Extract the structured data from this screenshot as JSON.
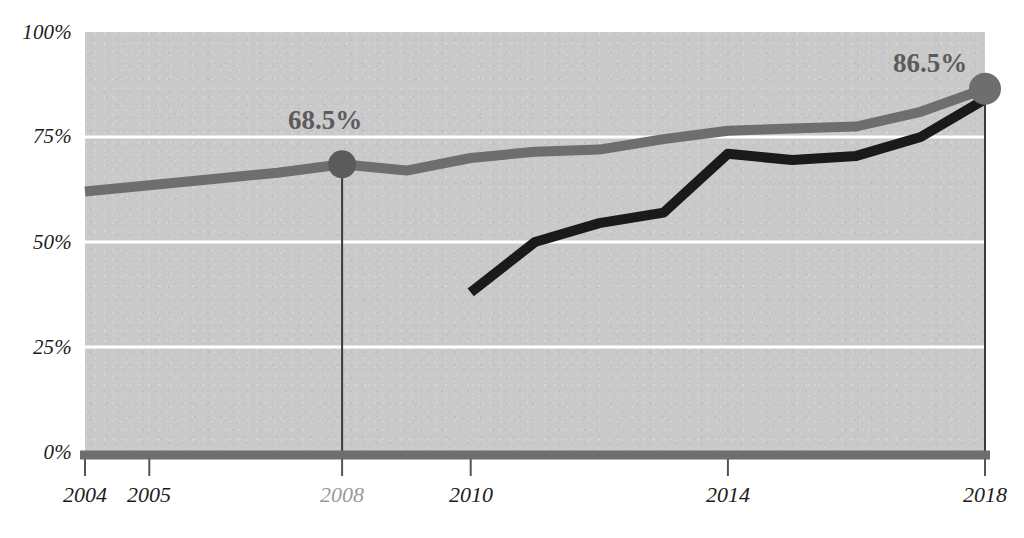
{
  "chart_data": {
    "type": "line",
    "title": "",
    "xlabel": "",
    "ylabel": "",
    "xlim": [
      2004,
      2018
    ],
    "ylim": [
      0,
      100
    ],
    "grid": true,
    "legend_position": "none",
    "y_ticks": [
      "0%",
      "25%",
      "50%",
      "75%",
      "100%"
    ],
    "y_tick_values": [
      0,
      25,
      50,
      75,
      100
    ],
    "x_ticks": [
      "2004",
      "2005",
      "2008",
      "2010",
      "2014",
      "2018"
    ],
    "x_tick_values": [
      2004,
      2005,
      2008,
      2010,
      2014,
      2018
    ],
    "series": [
      {
        "name": "gray-line",
        "color": "#6e6e6e",
        "x": [
          2004,
          2005,
          2006,
          2007,
          2008,
          2009,
          2010,
          2011,
          2012,
          2013,
          2014,
          2015,
          2016,
          2017,
          2018
        ],
        "values": [
          62.0,
          63.5,
          65.0,
          66.5,
          68.5,
          67.0,
          70.0,
          71.5,
          72.0,
          74.5,
          76.5,
          77.0,
          77.5,
          81.0,
          86.5
        ]
      },
      {
        "name": "black-line",
        "color": "#1a1a1a",
        "x": [
          2010,
          2011,
          2012,
          2013,
          2014,
          2015,
          2016,
          2017,
          2018
        ],
        "values": [
          38.0,
          50.0,
          54.5,
          57.0,
          71.0,
          69.5,
          70.5,
          75.0,
          84.0
        ]
      }
    ],
    "annotations": [
      {
        "name": "callout-2008",
        "label": "68.5%",
        "x": 2008,
        "y": 68.5,
        "color": "#5b5b5b",
        "marker": true,
        "leader_line": true
      },
      {
        "name": "callout-2018",
        "label": "86.5%",
        "x": 2018,
        "y": 86.5,
        "color": "#6e6e6e",
        "marker": true,
        "leader_line": true
      }
    ]
  },
  "axis": {
    "y_labels": [
      {
        "text": "100%",
        "value": 100
      },
      {
        "text": "75%",
        "value": 75
      },
      {
        "text": "50%",
        "value": 50
      },
      {
        "text": "25%",
        "value": 25
      },
      {
        "text": "0%",
        "value": 0
      }
    ],
    "x_labels": [
      {
        "text": "2004",
        "value": 2004,
        "muted": false
      },
      {
        "text": "2005",
        "value": 2005,
        "muted": false
      },
      {
        "text": "2008",
        "value": 2008,
        "muted": true
      },
      {
        "text": "2010",
        "value": 2010,
        "muted": false
      },
      {
        "text": "2014",
        "value": 2014,
        "muted": false
      },
      {
        "text": "2018",
        "value": 2018,
        "muted": false
      }
    ]
  },
  "callouts": {
    "left_label": "68.5%",
    "right_label": "86.5%"
  },
  "colors": {
    "plot_background": "#c9c9c9",
    "gridline": "#ffffff",
    "gray_series": "#6e6e6e",
    "black_series": "#1a1a1a",
    "axis_line": "#6e6e6e",
    "tick": "#555555",
    "label_text": "#1c1c1c",
    "muted_text": "#9a9a9a",
    "value_text": "#5b5b5b"
  },
  "cropped_header": {
    "text": ""
  }
}
